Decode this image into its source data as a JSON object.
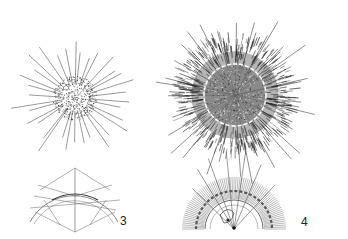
{
  "plate": {
    "background": "#ffffff",
    "ink": "#1a1a1a",
    "figures": [
      {
        "id": "fig-a",
        "description": "small radiolarian with spiny cortex and radiating spines",
        "center": [
          75,
          98
        ],
        "core_radius": 22,
        "spine_length": 62,
        "spine_count": 34
      },
      {
        "id": "fig-b",
        "description": "large radiolarian with dense dark cortex, dashed inner capsule and long spines",
        "center": [
          235,
          95
        ],
        "body_radius": 56,
        "capsule_radius": 30,
        "spine_length": 88,
        "spine_count": 30
      },
      {
        "id": "fig-3",
        "label": "3",
        "description": "detail of spine arrangement over arc"
      },
      {
        "id": "fig-4",
        "label": "4",
        "description": "half-section showing radial spines and central capsule"
      }
    ]
  },
  "labels": {
    "fig3": "3",
    "fig4": "4"
  }
}
